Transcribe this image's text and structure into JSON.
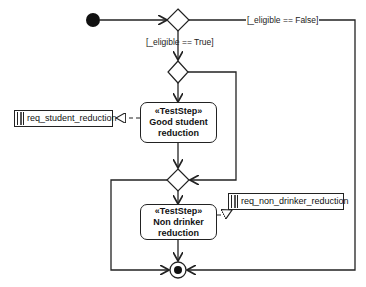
{
  "diagram": {
    "type": "UML activity diagram",
    "colors": {
      "stroke": "#222222",
      "background": "#ffffff"
    },
    "nodes": {
      "initial": {
        "kind": "initial-node"
      },
      "decision_eligible": {
        "kind": "decision-node"
      },
      "decision_student": {
        "kind": "decision-node"
      },
      "merge_student": {
        "kind": "merge-node"
      },
      "final": {
        "kind": "activity-final-node"
      }
    },
    "guards": {
      "eligible_false": "[_eligible == False]",
      "eligible_true": "[_eligible == True]"
    },
    "actions": [
      {
        "stereotype": "«TestStep»",
        "line1": "Good student",
        "line2": "reduction"
      },
      {
        "stereotype": "«TestStep»",
        "line1": "Non drinker",
        "line2": "reduction"
      }
    ],
    "requirements": [
      {
        "label": "req_student_reduction"
      },
      {
        "label": "req_non_drinker_reduction"
      }
    ]
  }
}
